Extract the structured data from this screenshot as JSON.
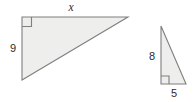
{
  "figure": {
    "background_color": "#ffffff",
    "fill_color": "#eeeeed",
    "stroke_color": "#7f7f7f",
    "label_color": "#2b2b2b",
    "triangles": [
      {
        "name": "large-triangle",
        "right_angle_position": "top-left",
        "labels": {
          "top": "x",
          "left": "9"
        }
      },
      {
        "name": "small-triangle",
        "right_angle_position": "bottom-left",
        "labels": {
          "left": "8",
          "bottom": "5"
        }
      }
    ]
  }
}
